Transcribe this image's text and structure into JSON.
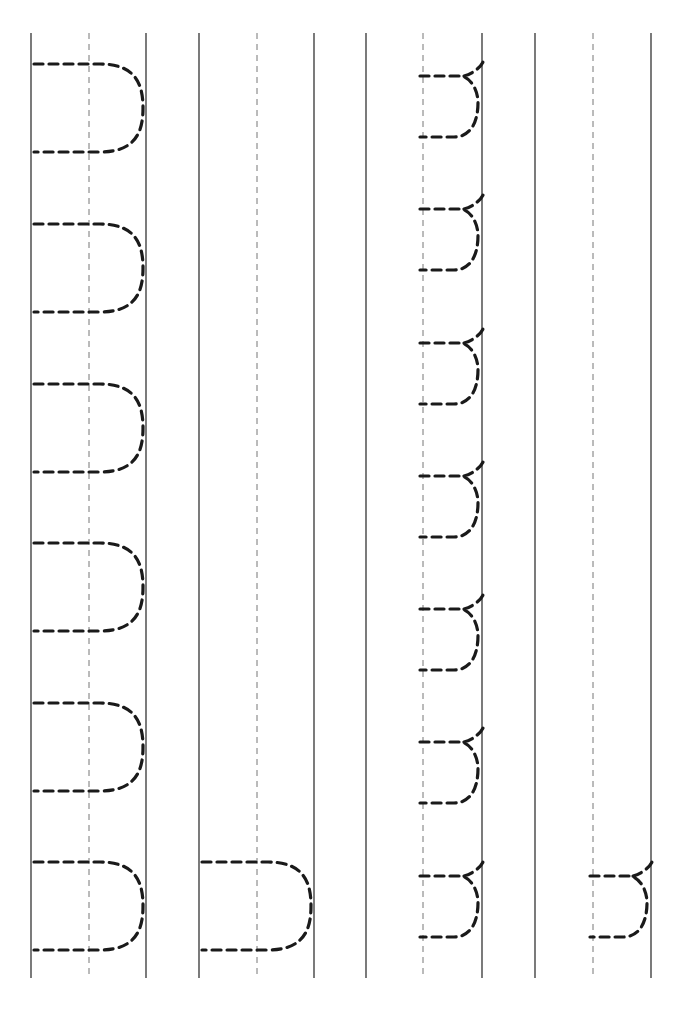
{
  "worksheet": {
    "type": "letter-tracing",
    "orientation": "rotated-90",
    "ink_color": "#1a1a1a",
    "line_color": "#333333",
    "guide_color": "#666666",
    "line_top": 33,
    "line_bottom": 978,
    "columns": [
      {
        "name": "uppercase-U-full",
        "left": 31,
        "guide": 89,
        "right": 146,
        "letter": "U",
        "size": "large",
        "tops": [
          64,
          224,
          384,
          543,
          703,
          862
        ],
        "height": 88
      },
      {
        "name": "uppercase-U-single",
        "left": 199,
        "guide": 257,
        "right": 314,
        "letter": "U",
        "size": "large",
        "tops": [
          862
        ],
        "height": 88
      },
      {
        "name": "lowercase-u-full",
        "left": 366,
        "guide": 423,
        "right": 482,
        "letter": "u",
        "size": "small",
        "tops": [
          76,
          209,
          343,
          476,
          609,
          742,
          876
        ],
        "height": 61
      },
      {
        "name": "lowercase-u-single",
        "left": 535,
        "guide": 593,
        "right": 651,
        "letter": "u",
        "size": "small",
        "tops": [
          876
        ],
        "height": 61
      }
    ]
  }
}
